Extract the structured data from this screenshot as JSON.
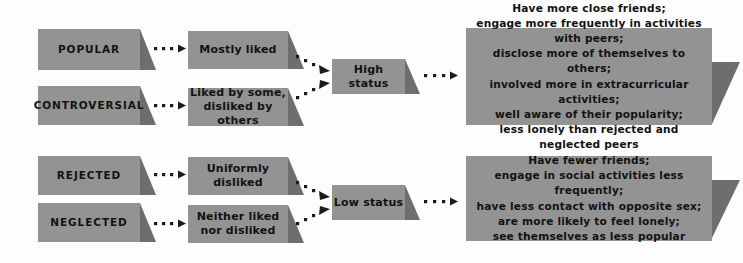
{
  "diagram": {
    "colors": {
      "background": "#fdfdfd",
      "box_fill": "#939393",
      "text": "#121212",
      "shadow": "#6e6e6e",
      "arrow": "#1a1a1a"
    },
    "categories": [
      {
        "id": "popular",
        "label": "POPULAR"
      },
      {
        "id": "controversial",
        "label": "CONTROVERSIAL"
      },
      {
        "id": "rejected",
        "label": "REJECTED"
      },
      {
        "id": "neglected",
        "label": "NEGLECTED"
      }
    ],
    "descriptions": [
      {
        "id": "mostly-liked",
        "label": "Mostly liked"
      },
      {
        "id": "liked-by-some",
        "label": "Liked by some,\ndisliked by others"
      },
      {
        "id": "uniformly-disliked",
        "label": "Uniformly disliked"
      },
      {
        "id": "neither-liked",
        "label": "Neither liked\nnor disliked"
      }
    ],
    "statuses": [
      {
        "id": "high-status",
        "label": "High status"
      },
      {
        "id": "low-status",
        "label": "Low status"
      }
    ],
    "outcomes": [
      {
        "id": "high-status-outcomes",
        "label": "Have more close friends;\nengage more frequently in activities with peers;\ndisclose more of themselves to others;\ninvolved more in extracurricular activities;\nwell aware of their popularity;\nless lonely than rejected and neglected peers"
      },
      {
        "id": "low-status-outcomes",
        "label": "Have fewer friends;\nengage in social activities less frequently;\nhave less contact with opposite sex;\nare more likely to feel lonely;\nsee themselves as less popular"
      }
    ]
  }
}
